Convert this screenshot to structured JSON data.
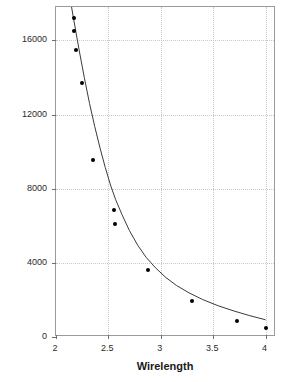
{
  "chart_data": {
    "type": "scatter",
    "title": "",
    "xlabel": "Wirelength",
    "ylabel": "Inter-Tier Vias",
    "xlim": [
      2,
      4.1
    ],
    "ylim": [
      0,
      17800
    ],
    "grid": true,
    "legend": null,
    "x_ticks": [
      "2",
      "2.5",
      "3",
      "3.5",
      "4"
    ],
    "x_tick_values": [
      2,
      2.5,
      3,
      3.5,
      4
    ],
    "y_ticks": [
      "0",
      "4000",
      "8000",
      "12000",
      "16000"
    ],
    "y_tick_values": [
      0,
      4000,
      8000,
      12000,
      16000
    ],
    "series": [
      {
        "name": "Inter-Tier Vias",
        "marker": "filled-circle",
        "color": "#000000",
        "x": [
          2.17,
          2.17,
          2.19,
          2.25,
          2.35,
          2.55,
          2.56,
          2.88,
          3.3,
          3.73,
          4.0
        ],
        "y": [
          17200,
          16500,
          15500,
          13700,
          9540,
          6850,
          6120,
          3600,
          1960,
          850,
          460
        ]
      }
    ],
    "fit_curve": {
      "name": "fitted-trend",
      "color": "#3b3b3b",
      "x": [
        2.13,
        2.17,
        2.22,
        2.27,
        2.32,
        2.37,
        2.42,
        2.47,
        2.52,
        2.57,
        2.63,
        2.7,
        2.78,
        2.86,
        2.95,
        3.05,
        3.15,
        3.27,
        3.4,
        3.55,
        3.7,
        3.85,
        4.0
      ],
      "y": [
        18400,
        17100,
        15500,
        14000,
        12600,
        11350,
        10200,
        9150,
        8200,
        7400,
        6600,
        5750,
        4950,
        4300,
        3730,
        3200,
        2780,
        2380,
        2020,
        1680,
        1400,
        1150,
        930
      ]
    }
  },
  "axes": {
    "x_title": "Wirelength",
    "y_title": "Inter-Tier Vias"
  }
}
